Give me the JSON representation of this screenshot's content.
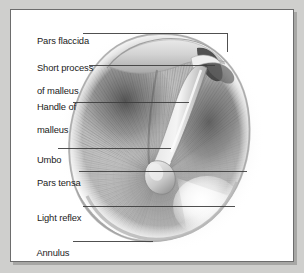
{
  "figure": {
    "background_color": "#cfcfcd",
    "panel_color": "#ffffff",
    "border_color": "#6d6d6d",
    "label_color": "#1b1b1b",
    "leader_color": "#3d3d3d",
    "drawing_style": "grayscale halftone medical illustration"
  },
  "labels": [
    {
      "id": "pars-flaccida",
      "text": "Pars flaccida",
      "x": 21,
      "y": 19,
      "leader": "horizontal then elbow down to superior membrane"
    },
    {
      "id": "short-process-of-malleus",
      "text": "Short process",
      "text2": "of malleus",
      "x": 21,
      "y": 46,
      "leader": "horizontal to lateral process of malleus"
    },
    {
      "id": "handle-of-malleus",
      "text": "Handle of",
      "text2": "malleus",
      "x": 21,
      "y": 85,
      "leader": "horizontal to manubrium"
    },
    {
      "id": "umbo",
      "text": "Umbo",
      "x": 21,
      "y": 143,
      "leader": "horizontal to umbo tip"
    },
    {
      "id": "pars-tensa",
      "text": "Pars tensa",
      "x": 21,
      "y": 167,
      "leader": "horizontal across pars tensa"
    },
    {
      "id": "light-reflex",
      "text": "Light reflex",
      "x": 21,
      "y": 202,
      "leader": "horizontal to cone of light"
    },
    {
      "id": "annulus",
      "text": "Annulus",
      "x": 21,
      "y": 238,
      "leader": "horizontal to inferior rim"
    }
  ],
  "anatomy": {
    "membrane_shape": "oval / egg-shaped tympanic membrane",
    "regions": [
      "pars flaccida (superior band)",
      "pars tensa (main radially striated field)",
      "anterior-superior quadrant (dark)",
      "posterior quadrant (dark shading)",
      "cone of light (antero-inferior bright triangle)"
    ],
    "ossicle": "malleus: lateral (short) process and handle (manubrium) ending at umbo"
  }
}
